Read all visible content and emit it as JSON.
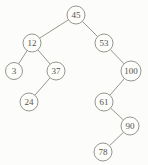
{
  "diagram": {
    "type": "binary-search-tree",
    "title": "",
    "colors": {
      "background": "#fcfcfa",
      "node_fill": "#fdfdfc",
      "node_stroke": "#8a8a82",
      "edge": "#8a8a82",
      "text": "#55524a"
    },
    "default_radius": 9,
    "nodes": [
      {
        "id": "45",
        "label": "45",
        "x": 76,
        "y": 15,
        "r": 9
      },
      {
        "id": "12",
        "label": "12",
        "x": 32,
        "y": 43,
        "r": 9
      },
      {
        "id": "53",
        "label": "53",
        "x": 104,
        "y": 43,
        "r": 9
      },
      {
        "id": "3",
        "label": "3",
        "x": 14,
        "y": 71,
        "r": 8.5
      },
      {
        "id": "37",
        "label": "37",
        "x": 56,
        "y": 71,
        "r": 9
      },
      {
        "id": "100",
        "label": "100",
        "x": 131,
        "y": 71,
        "r": 10
      },
      {
        "id": "24",
        "label": "24",
        "x": 29,
        "y": 102,
        "r": 9
      },
      {
        "id": "61",
        "label": "61",
        "x": 104,
        "y": 102,
        "r": 9
      },
      {
        "id": "90",
        "label": "90",
        "x": 130,
        "y": 126,
        "r": 9
      },
      {
        "id": "78",
        "label": "78",
        "x": 103,
        "y": 152,
        "r": 9
      }
    ],
    "edges": [
      {
        "from": "45",
        "to": "12"
      },
      {
        "from": "45",
        "to": "53"
      },
      {
        "from": "12",
        "to": "3"
      },
      {
        "from": "12",
        "to": "37"
      },
      {
        "from": "37",
        "to": "24"
      },
      {
        "from": "53",
        "to": "100"
      },
      {
        "from": "100",
        "to": "61"
      },
      {
        "from": "61",
        "to": "90"
      },
      {
        "from": "90",
        "to": "78"
      }
    ]
  }
}
